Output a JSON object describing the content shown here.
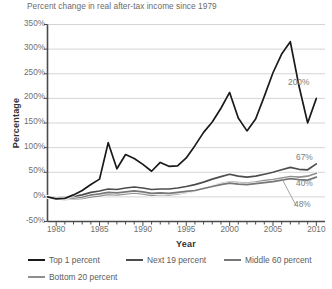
{
  "chart_data": {
    "type": "line",
    "title": "Percent change in real after-tax income since 1979",
    "xlabel": "Year",
    "ylabel": "Percentage",
    "xlim": [
      1979,
      2011
    ],
    "ylim": [
      -50,
      350
    ],
    "ytick_labels": [
      "350%",
      "300%",
      "250%",
      "200%",
      "150%",
      "100%",
      "50%",
      "0%",
      "-50%"
    ],
    "ytick_values": [
      350,
      300,
      250,
      200,
      150,
      100,
      50,
      0,
      -50
    ],
    "xtick_labels": [
      "1980",
      "1985",
      "1990",
      "1995",
      "2000",
      "2005",
      "2010"
    ],
    "xtick_values": [
      1980,
      1985,
      1990,
      1995,
      2000,
      2005,
      2010
    ],
    "grid": "horizontal",
    "legend_position": "bottom",
    "x": [
      1979,
      1980,
      1981,
      1982,
      1983,
      1984,
      1985,
      1986,
      1987,
      1988,
      1989,
      1990,
      1991,
      1992,
      1993,
      1994,
      1995,
      1996,
      1997,
      1998,
      1999,
      2000,
      2001,
      2002,
      2003,
      2004,
      2005,
      2006,
      2007,
      2008,
      2009,
      2010
    ],
    "series": [
      {
        "name": "Top 1 percent",
        "color": "#1a1a1a",
        "end_label": "200%",
        "values": [
          0,
          -4,
          -3,
          4,
          13,
          25,
          36,
          110,
          57,
          86,
          78,
          66,
          52,
          70,
          62,
          63,
          79,
          104,
          131,
          152,
          180,
          212,
          160,
          134,
          158,
          204,
          252,
          290,
          315,
          225,
          150,
          200
        ]
      },
      {
        "name": "Next 19 percent",
        "color": "#4d4d4d",
        "end_label": "67%",
        "values": [
          0,
          -2,
          -1,
          1,
          4,
          9,
          12,
          16,
          15,
          18,
          20,
          18,
          15,
          16,
          16,
          18,
          21,
          25,
          30,
          36,
          41,
          46,
          42,
          40,
          42,
          46,
          50,
          55,
          60,
          56,
          55,
          67
        ]
      },
      {
        "name": "Middle 60 percent",
        "color": "#777777",
        "end_label": "40%",
        "values": [
          0,
          -3,
          -3,
          -2,
          0,
          4,
          6,
          9,
          8,
          10,
          12,
          10,
          7,
          8,
          7,
          9,
          11,
          13,
          17,
          21,
          25,
          28,
          26,
          25,
          27,
          29,
          31,
          34,
          37,
          35,
          34,
          40
        ]
      },
      {
        "name": "Bottom 20 percent",
        "color": "#8f8f8f",
        "end_label": "48%",
        "values": [
          0,
          -4,
          -5,
          -4,
          -3,
          0,
          2,
          5,
          4,
          6,
          8,
          6,
          3,
          5,
          4,
          6,
          9,
          12,
          17,
          22,
          27,
          30,
          29,
          28,
          30,
          33,
          35,
          38,
          41,
          40,
          42,
          48
        ]
      }
    ],
    "annotations": [
      {
        "text": "200%",
        "series": "Top 1 percent"
      },
      {
        "text": "67%",
        "series": "Next 19 percent"
      },
      {
        "text": "40%",
        "series": "Middle 60 percent"
      },
      {
        "text": "48%",
        "series": "Bottom 20 percent",
        "leader_line": true
      }
    ]
  }
}
